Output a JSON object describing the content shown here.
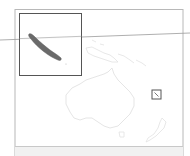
{
  "map": {
    "type": "locator-map",
    "subject": "New Caledonia",
    "region": "Oceania",
    "colors": {
      "background": "#ffffff",
      "frame": "#b8b8b8",
      "inset_frame": "#555555",
      "land_outline": "#e2e2e2",
      "highlight_land": "#6a6a6a",
      "locator_box": "#555555",
      "graticule": "#9a9a9a",
      "bottom_strip": "#f1f1f1"
    },
    "inset": {
      "label": "",
      "shows": "New Caledonia (Grande Terre) enlarged"
    },
    "locator_marker": {
      "shape": "square",
      "position_hint": "east of Australia"
    },
    "landmasses": [
      "Australia",
      "New Guinea",
      "Solomon Islands",
      "New Zealand",
      "New Caledonia"
    ]
  }
}
